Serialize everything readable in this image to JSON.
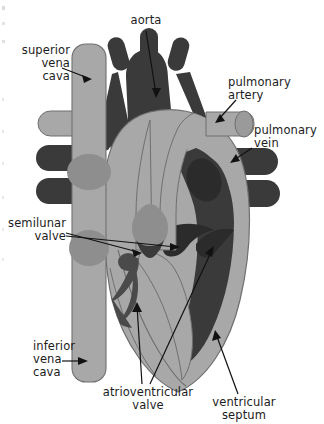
{
  "figure": {
    "type": "anatomical-diagram",
    "background_color": "#ffffff"
  },
  "palette": {
    "light_muscle": "#a8a8a8",
    "mid_gray": "#8e8e8e",
    "dark_chamber": "#3a3a3a",
    "darker_inset": "#2b2b2b",
    "outline": "#6f6f6f",
    "text": "#1c1c1c",
    "leader_line": "#111111"
  },
  "labels": {
    "aorta": "aorta",
    "superior_vena_cava": "superior\nvena\ncava",
    "pulmonary_artery": "pulmonary\nartery",
    "pulmonary_vein": "pulmonary\nvein",
    "semilunar_valve": "semilunar\nvalve",
    "inferior_vena_cava": "inferior\nvena\ncava",
    "atrioventricular_valve": "atrioventricular\nvalve",
    "ventricular_septum": "ventricular\nseptum"
  },
  "structures": [
    {
      "name": "aortic-arch",
      "color": "#3a3a3a"
    },
    {
      "name": "aortic-branch-vessels",
      "count": 3,
      "color": "#3a3a3a"
    },
    {
      "name": "superior-vena-cava-trunk",
      "color": "#a8a8a8"
    },
    {
      "name": "inferior-vena-cava-trunk",
      "color": "#a8a8a8"
    },
    {
      "name": "pulmonary-artery-vessel",
      "color": "#a8a8a8"
    },
    {
      "name": "pulmonary-vein-vessels",
      "count": 2,
      "color": "#3a3a3a"
    },
    {
      "name": "left-vessel-stub-light",
      "color": "#a8a8a8"
    },
    {
      "name": "left-vessel-stubs-dark",
      "count": 2,
      "color": "#3a3a3a"
    },
    {
      "name": "pulmonary-trunk",
      "color": "#a8a8a8"
    },
    {
      "name": "right-atrium-cavity",
      "color": "#8e8e8e"
    },
    {
      "name": "left-ventricle-cavity",
      "color": "#3a3a3a"
    },
    {
      "name": "left-atrium-cavity",
      "color": "#3a3a3a"
    },
    {
      "name": "ventricular-septum-wall",
      "color": "#a8a8a8"
    },
    {
      "name": "semilunar-valve-cusps",
      "color": "#8e8e8e"
    },
    {
      "name": "atrioventricular-valve-leaflets",
      "color": "#5a5a5a"
    },
    {
      "name": "heart-myocardium",
      "color": "#a8a8a8"
    }
  ]
}
